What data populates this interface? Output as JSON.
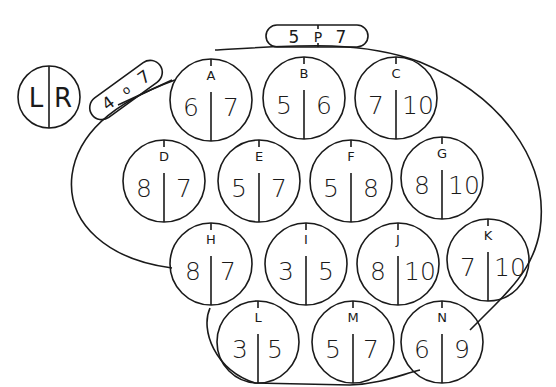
{
  "diagram": {
    "legend": {
      "left": "L",
      "right": "R"
    },
    "pill_top": {
      "left": "5",
      "center": "P",
      "right": "7"
    },
    "pill_left": {
      "left": "4",
      "center": "o",
      "right": "7"
    },
    "circles": [
      {
        "label": "A",
        "left": "6",
        "right": "7"
      },
      {
        "label": "B",
        "left": "5",
        "right": "6"
      },
      {
        "label": "C",
        "left": "7",
        "right": "10"
      },
      {
        "label": "D",
        "left": "8",
        "right": "7"
      },
      {
        "label": "E",
        "left": "5",
        "right": "7"
      },
      {
        "label": "F",
        "left": "5",
        "right": "8"
      },
      {
        "label": "G",
        "left": "8",
        "right": "10"
      },
      {
        "label": "H",
        "left": "8",
        "right": "7"
      },
      {
        "label": "I",
        "left": "3",
        "right": "5"
      },
      {
        "label": "J",
        "left": "8",
        "right": "10"
      },
      {
        "label": "K",
        "left": "7",
        "right": "10"
      },
      {
        "label": "L",
        "left": "3",
        "right": "5"
      },
      {
        "label": "M",
        "left": "5",
        "right": "7"
      },
      {
        "label": "N",
        "left": "6",
        "right": "9"
      }
    ]
  }
}
